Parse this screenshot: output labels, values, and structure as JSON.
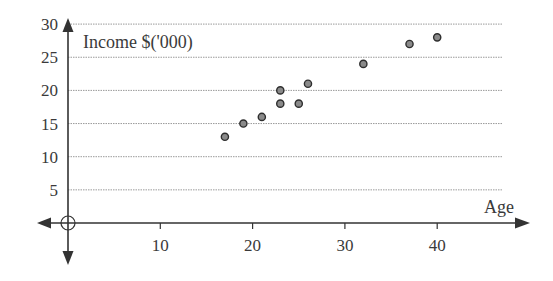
{
  "chart_data": {
    "type": "scatter",
    "title": "",
    "xlabel": "Age",
    "ylabel": "Income $('000)",
    "xlim": [
      0,
      48
    ],
    "ylim": [
      0,
      30
    ],
    "x_ticks": [
      10,
      20,
      30,
      40
    ],
    "y_ticks": [
      5,
      10,
      15,
      20,
      25,
      30
    ],
    "grid": {
      "horizontal": true,
      "vertical": false,
      "style": "dotted"
    },
    "legend": null,
    "series": [
      {
        "name": "Income vs Age",
        "points": [
          {
            "x": 17,
            "y": 13
          },
          {
            "x": 19,
            "y": 15
          },
          {
            "x": 21,
            "y": 16
          },
          {
            "x": 23,
            "y": 18
          },
          {
            "x": 23,
            "y": 20
          },
          {
            "x": 25,
            "y": 18
          },
          {
            "x": 26,
            "y": 21
          },
          {
            "x": 32,
            "y": 24
          },
          {
            "x": 37,
            "y": 27
          },
          {
            "x": 40,
            "y": 28
          }
        ]
      }
    ],
    "origin_marker": "crosshair-circle",
    "axis_arrows": [
      "left",
      "right",
      "up",
      "down"
    ]
  },
  "colors": {
    "axis": "#333333",
    "grid": "#9a9a9a",
    "marker_fill": "#8a8a8a",
    "marker_stroke": "#2e2e2e",
    "text": "#3a3a3a"
  }
}
